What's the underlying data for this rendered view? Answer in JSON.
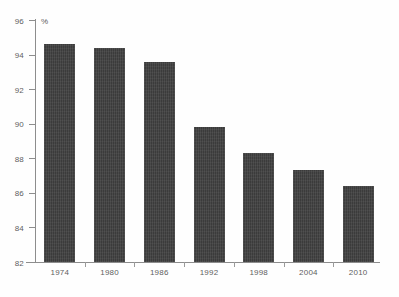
{
  "chart_data": {
    "type": "bar",
    "title": "",
    "subtitle": "",
    "xlabel": "",
    "ylabel": "%",
    "unit_label": "%",
    "categories": [
      "1974",
      "1980",
      "1986",
      "1992",
      "1998",
      "2004",
      "2010"
    ],
    "values": [
      94.6,
      94.4,
      93.6,
      89.8,
      88.3,
      87.3,
      86.4
    ],
    "series": [
      {
        "name": "",
        "values": [
          94.6,
          94.4,
          93.6,
          89.8,
          88.3,
          87.3,
          86.4
        ]
      }
    ],
    "ylim": [
      82,
      96
    ],
    "ytick_labels": [
      "96",
      "94",
      "92",
      "90",
      "88",
      "86",
      "84",
      "82"
    ],
    "ytick_values": [
      96,
      94,
      92,
      90,
      88,
      86,
      84,
      82
    ],
    "ytick_step": 2,
    "grid": false,
    "legend": null,
    "legend_position": "none",
    "annotations": [],
    "bar_color": "#3b3b3b",
    "axis_color": "#8d8d8d",
    "label_color": "#5e5e5e",
    "background_color": "#fefefe"
  }
}
